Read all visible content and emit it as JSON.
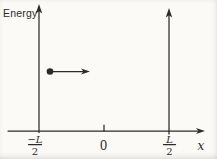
{
  "figure": {
    "energy_axis_label": "Energy",
    "x_axis_label": "x",
    "origin_tick_label": "0",
    "left_wall_label": {
      "numerator": "−L",
      "denominator": "2"
    },
    "right_wall_label": {
      "numerator": "L",
      "denominator": "2"
    }
  },
  "colors": {
    "ink": "#2d2b28",
    "paper": "#fbfaf7"
  }
}
